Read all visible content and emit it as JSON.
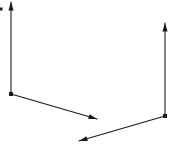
{
  "canvas": {
    "width": 173,
    "height": 146,
    "background_color": "#ffffff"
  },
  "diagram": {
    "stroke_color": "#1a1a1a",
    "stroke_width": 1.1,
    "arrowhead": {
      "length": 8.5,
      "half_width": 2.6
    },
    "origin_dot_size": 4,
    "frames": [
      {
        "name": "left-frame",
        "origin": {
          "x": 11,
          "y": 94
        },
        "arrows": [
          {
            "name": "left-frame-vertical-axis-arrow",
            "tip": {
              "x": 11,
              "y": 2
            }
          },
          {
            "name": "left-frame-diagonal-axis-arrow",
            "tip": {
              "x": 97,
              "y": 119
            }
          }
        ]
      },
      {
        "name": "right-frame",
        "origin": {
          "x": 165,
          "y": 116
        },
        "arrows": [
          {
            "name": "right-frame-vertical-axis-arrow",
            "tip": {
              "x": 165,
              "y": 23
            }
          },
          {
            "name": "right-frame-diagonal-axis-arrow",
            "tip": {
              "x": 79,
              "y": 141
            }
          }
        ]
      }
    ],
    "stray_dot": {
      "x": 1,
      "y": 9,
      "size": 3
    }
  }
}
